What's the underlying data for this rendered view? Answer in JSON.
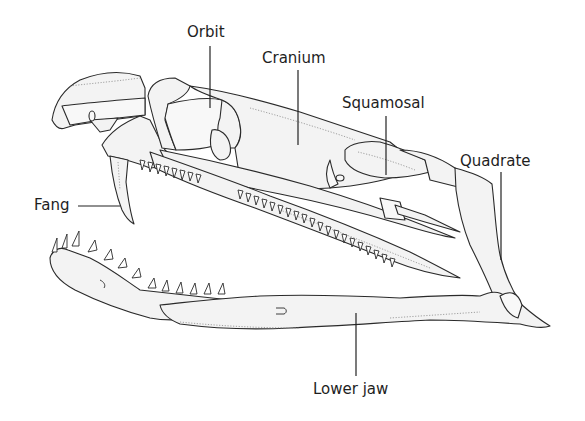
{
  "diagram": {
    "labels": [
      {
        "id": "orbit",
        "text": "Orbit"
      },
      {
        "id": "cranium",
        "text": "Cranium"
      },
      {
        "id": "squamosal",
        "text": "Squamosal"
      },
      {
        "id": "quadrate",
        "text": "Quadrate"
      },
      {
        "id": "fang",
        "text": "Fang"
      },
      {
        "id": "lower-jaw",
        "text": "Lower jaw"
      }
    ],
    "colors": {
      "background": "#ffffff",
      "bone_fill": "#f3f3f3",
      "outline": "#2a2a2a",
      "label_text": "#1e1e1e"
    }
  }
}
